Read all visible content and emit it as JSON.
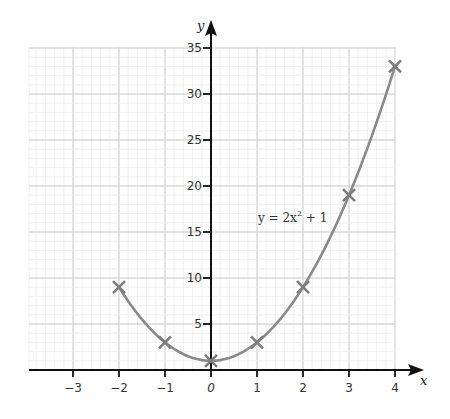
{
  "chart_data": {
    "type": "line",
    "title": "",
    "xlabel": "x",
    "ylabel": "y",
    "xlim": [
      -4,
      4
    ],
    "ylim": [
      0,
      35
    ],
    "x_ticks": [
      -3,
      -2,
      -1,
      0,
      1,
      2,
      3,
      4
    ],
    "x_tick_labels": [
      "−3",
      "−2",
      "−1",
      "0",
      "1",
      "2",
      "3",
      "4"
    ],
    "y_ticks": [
      5,
      10,
      15,
      20,
      25,
      30,
      35
    ],
    "y_tick_labels": [
      "5",
      "10",
      "15",
      "20",
      "25",
      "30",
      "35"
    ],
    "grid": true,
    "annotation": "y = 2x² + 1",
    "series": [
      {
        "name": "y = 2x^2 + 1",
        "x": [
          -2,
          -1,
          0,
          1,
          2,
          3,
          4
        ],
        "values": [
          9,
          3,
          1,
          3,
          9,
          19,
          33
        ],
        "marker": "x",
        "color": "#8a8a8a"
      }
    ]
  },
  "colors": {
    "axis": "#111111",
    "grid_major": "#d9d9d9",
    "grid_minor": "#ececec",
    "curve": "#8a8a8a"
  },
  "labels": {
    "x_axis": "x",
    "y_axis": "y",
    "equation_prefix": "y = 2x",
    "equation_sup": "2",
    "equation_suffix": " + 1"
  }
}
